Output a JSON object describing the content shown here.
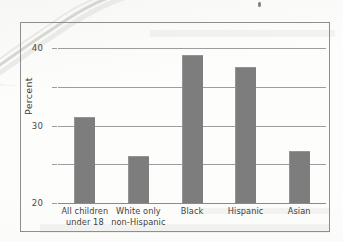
{
  "chart_data": {
    "type": "bar",
    "title": "",
    "xlabel": "",
    "ylabel": "Percent",
    "ylim": [
      0,
      40
    ],
    "yticks": [
      0,
      10,
      20,
      30,
      40
    ],
    "ytick_labels": [
      "0",
      "10",
      "20",
      "30",
      "40"
    ],
    "grid": true,
    "legend": "none",
    "orientation": "vertical",
    "categories": [
      "All children under 18",
      "White only non-Hispanic",
      "Black",
      "Hispanic",
      "Asian"
    ],
    "category_lines": [
      [
        "All children",
        "under 18"
      ],
      [
        "White only",
        "non-Hispanic"
      ],
      [
        "Black",
        ""
      ],
      [
        "Hispanic",
        ""
      ],
      [
        "Asian",
        ""
      ]
    ],
    "values": [
      22.2,
      12.2,
      38.1,
      35.0,
      13.4
    ],
    "bar_color": "#7d7d7d",
    "grid_color": "#9d9d9d",
    "frame_color": "#8e8e8e",
    "text_color": "#3f3f3f"
  },
  "artifacts": {
    "crease_name": "page-crease-artifact",
    "speck_name": "ink-speck-artifact"
  }
}
